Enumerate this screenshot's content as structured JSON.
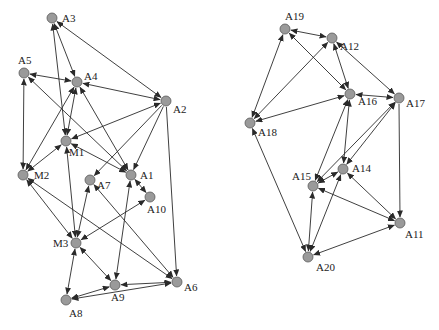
{
  "diagram": {
    "type": "directed-network",
    "arrow_color": "#2a2a2a",
    "node_fill": "#9a9a9a",
    "graphs": [
      {
        "name": "left-cluster",
        "nodes": [
          {
            "id": "A3",
            "label": "A3",
            "x": 52,
            "y": 18,
            "lx": 10,
            "ly": 4
          },
          {
            "id": "A4",
            "label": "A4",
            "x": 77,
            "y": 82,
            "lx": 7,
            "ly": -2
          },
          {
            "id": "A5",
            "label": "A5",
            "x": 24,
            "y": 73,
            "lx": -6,
            "ly": -9
          },
          {
            "id": "A2",
            "label": "A2",
            "x": 166,
            "y": 101,
            "lx": 7,
            "ly": 12
          },
          {
            "id": "M1",
            "label": "M1",
            "x": 66,
            "y": 141,
            "lx": 3,
            "ly": 15
          },
          {
            "id": "M2",
            "label": "M2",
            "x": 23,
            "y": 175,
            "lx": 11,
            "ly": 4
          },
          {
            "id": "A7",
            "label": "A7",
            "x": 90,
            "y": 180,
            "lx": 7,
            "ly": 9
          },
          {
            "id": "A1",
            "label": "A1",
            "x": 131,
            "y": 175,
            "lx": 9,
            "ly": 4
          },
          {
            "id": "A10",
            "label": "A10",
            "x": 150,
            "y": 197,
            "lx": -3,
            "ly": 16
          },
          {
            "id": "M3",
            "label": "M3",
            "x": 76,
            "y": 243,
            "lx": -23,
            "ly": 4
          },
          {
            "id": "A9",
            "label": "A9",
            "x": 115,
            "y": 285,
            "lx": -4,
            "ly": 16
          },
          {
            "id": "A6",
            "label": "A6",
            "x": 177,
            "y": 282,
            "lx": 7,
            "ly": 9
          },
          {
            "id": "A8",
            "label": "A8",
            "x": 66,
            "y": 300,
            "lx": 3,
            "ly": 17
          }
        ],
        "edges": [
          {
            "from": "A3",
            "to": "A4",
            "bidirectional": true
          },
          {
            "from": "A3",
            "to": "A2",
            "bidirectional": true
          },
          {
            "from": "M1",
            "to": "A3",
            "bidirectional": true
          },
          {
            "from": "A5",
            "to": "A4",
            "bidirectional": true
          },
          {
            "from": "A5",
            "to": "M2",
            "bidirectional": true
          },
          {
            "from": "A1",
            "to": "A5",
            "bidirectional": true
          },
          {
            "from": "A4",
            "to": "A2",
            "bidirectional": true
          },
          {
            "from": "A4",
            "to": "M1",
            "bidirectional": true
          },
          {
            "from": "M2",
            "to": "A4",
            "bidirectional": true
          },
          {
            "from": "A1",
            "to": "A4",
            "bidirectional": true
          },
          {
            "from": "A2",
            "to": "M1",
            "bidirectional": true
          },
          {
            "from": "A2",
            "to": "A7",
            "bidirectional": false
          },
          {
            "from": "A2",
            "to": "A1",
            "bidirectional": false
          },
          {
            "from": "A2",
            "to": "A6",
            "bidirectional": false
          },
          {
            "from": "M2",
            "to": "M1",
            "bidirectional": true
          },
          {
            "from": "M1",
            "to": "A1",
            "bidirectional": true
          },
          {
            "from": "M1",
            "to": "M3",
            "bidirectional": true
          },
          {
            "from": "M2",
            "to": "M3",
            "bidirectional": true
          },
          {
            "from": "M2",
            "to": "A6",
            "bidirectional": true
          },
          {
            "from": "A7",
            "to": "M3",
            "bidirectional": true
          },
          {
            "from": "A7",
            "to": "A6",
            "bidirectional": true
          },
          {
            "from": "A1",
            "to": "A10",
            "bidirectional": true
          },
          {
            "from": "A1",
            "to": "A9",
            "bidirectional": true
          },
          {
            "from": "A10",
            "to": "M3",
            "bidirectional": true
          },
          {
            "from": "M3",
            "to": "A8",
            "bidirectional": true
          },
          {
            "from": "M3",
            "to": "A9",
            "bidirectional": true
          },
          {
            "from": "A8",
            "to": "A9",
            "bidirectional": true
          },
          {
            "from": "A8",
            "to": "A6",
            "bidirectional": true
          },
          {
            "from": "A9",
            "to": "A6",
            "bidirectional": true
          }
        ]
      },
      {
        "name": "right-cluster",
        "nodes": [
          {
            "id": "A19",
            "label": "A19",
            "x": 285,
            "y": 29,
            "lx": 0,
            "ly": -9
          },
          {
            "id": "A12",
            "label": "A12",
            "x": 332,
            "y": 38,
            "lx": 8,
            "ly": 12
          },
          {
            "id": "A16",
            "label": "A16",
            "x": 350,
            "y": 94,
            "lx": 8,
            "ly": 11
          },
          {
            "id": "A17",
            "label": "A17",
            "x": 399,
            "y": 98,
            "lx": 7,
            "ly": 9
          },
          {
            "id": "A18",
            "label": "A18",
            "x": 250,
            "y": 123,
            "lx": 8,
            "ly": 13
          },
          {
            "id": "A14",
            "label": "A14",
            "x": 343,
            "y": 169,
            "lx": 9,
            "ly": 3
          },
          {
            "id": "A15",
            "label": "A15",
            "x": 313,
            "y": 186,
            "lx": -21,
            "ly": -6
          },
          {
            "id": "A11",
            "label": "A11",
            "x": 400,
            "y": 223,
            "lx": 5,
            "ly": 15
          },
          {
            "id": "A20",
            "label": "A20",
            "x": 308,
            "y": 257,
            "lx": 8,
            "ly": 14
          }
        ],
        "edges": [
          {
            "from": "A19",
            "to": "A12",
            "bidirectional": true
          },
          {
            "from": "A19",
            "to": "A16",
            "bidirectional": true
          },
          {
            "from": "A18",
            "to": "A19",
            "bidirectional": true
          },
          {
            "from": "A18",
            "to": "A12",
            "bidirectional": true
          },
          {
            "from": "A12",
            "to": "A16",
            "bidirectional": true
          },
          {
            "from": "A12",
            "to": "A17",
            "bidirectional": true
          },
          {
            "from": "A16",
            "to": "A17",
            "bidirectional": true
          },
          {
            "from": "A18",
            "to": "A16",
            "bidirectional": true
          },
          {
            "from": "A15",
            "to": "A16",
            "bidirectional": true
          },
          {
            "from": "A14",
            "to": "A16",
            "bidirectional": true
          },
          {
            "from": "A15",
            "to": "A17",
            "bidirectional": true
          },
          {
            "from": "A14",
            "to": "A17",
            "bidirectional": true
          },
          {
            "from": "A17",
            "to": "A11",
            "bidirectional": false
          },
          {
            "from": "A20",
            "to": "A18",
            "bidirectional": true
          },
          {
            "from": "A15",
            "to": "A14",
            "bidirectional": true
          },
          {
            "from": "A15",
            "to": "A11",
            "bidirectional": true
          },
          {
            "from": "A14",
            "to": "A11",
            "bidirectional": true
          },
          {
            "from": "A15",
            "to": "A20",
            "bidirectional": true
          },
          {
            "from": "A14",
            "to": "A20",
            "bidirectional": true
          },
          {
            "from": "A11",
            "to": "A20",
            "bidirectional": true
          }
        ]
      }
    ]
  }
}
